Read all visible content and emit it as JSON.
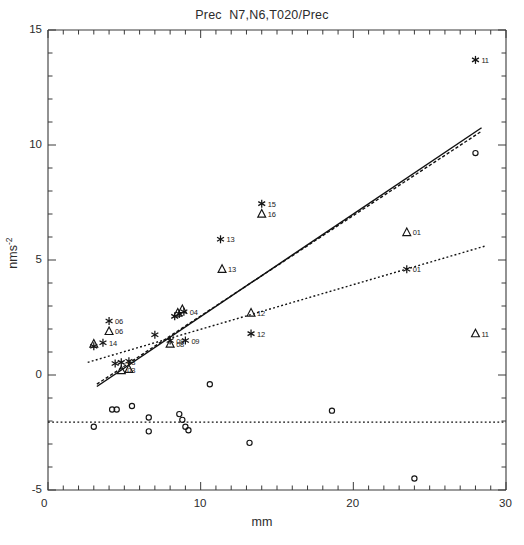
{
  "chart_data": {
    "type": "scatter",
    "title": "Prec  N7,N6,T020/Prec",
    "xlabel": "mm",
    "ylabel": "nms",
    "ylabel_superscript": "-2",
    "xlim": [
      0,
      30
    ],
    "ylim": [
      -5,
      15
    ],
    "x_ticks_major": [
      0,
      10,
      20,
      30
    ],
    "x_tick_labels": [
      "0",
      "10",
      "20",
      "30"
    ],
    "x_minor_interval": 1,
    "y_ticks_major": [
      -5,
      0,
      5,
      10,
      15
    ],
    "y_tick_labels": [
      "-5",
      "0",
      "5",
      "10",
      "15"
    ],
    "y_minor_interval": 1,
    "grid": false,
    "legend": "none",
    "series": [
      {
        "name": "star",
        "marker": "star",
        "points": [
          {
            "x": 28.0,
            "y": 13.7,
            "label": "11"
          },
          {
            "x": 14.0,
            "y": 7.45,
            "label": "15"
          },
          {
            "x": 11.3,
            "y": 5.9,
            "label": "13"
          },
          {
            "x": 23.5,
            "y": 4.6,
            "label": "01"
          },
          {
            "x": 4.0,
            "y": 2.35,
            "label": "06"
          },
          {
            "x": 8.9,
            "y": 2.75,
            "label": "04"
          },
          {
            "x": 8.6,
            "y": 2.65,
            "label": ""
          },
          {
            "x": 8.3,
            "y": 2.55,
            "label": ""
          },
          {
            "x": 7.0,
            "y": 1.75,
            "label": ""
          },
          {
            "x": 13.3,
            "y": 1.8,
            "label": "12"
          },
          {
            "x": 3.0,
            "y": 1.25,
            "label": ""
          },
          {
            "x": 3.6,
            "y": 1.4,
            "label": "14"
          },
          {
            "x": 8.0,
            "y": 1.5,
            "label": "08"
          },
          {
            "x": 9.0,
            "y": 1.5,
            "label": "09"
          },
          {
            "x": 4.8,
            "y": 0.55,
            "label": "03"
          },
          {
            "x": 5.3,
            "y": 0.6,
            "label": ""
          },
          {
            "x": 4.4,
            "y": 0.5,
            "label": ""
          }
        ]
      },
      {
        "name": "triangle",
        "marker": "triangle",
        "points": [
          {
            "x": 14.0,
            "y": 7.0,
            "label": "16"
          },
          {
            "x": 23.5,
            "y": 6.2,
            "label": "01"
          },
          {
            "x": 11.4,
            "y": 4.6,
            "label": "13"
          },
          {
            "x": 8.8,
            "y": 2.85,
            "label": ""
          },
          {
            "x": 8.5,
            "y": 2.7,
            "label": ""
          },
          {
            "x": 13.3,
            "y": 2.7,
            "label": "12"
          },
          {
            "x": 4.0,
            "y": 1.9,
            "label": "06"
          },
          {
            "x": 3.0,
            "y": 1.35,
            "label": ""
          },
          {
            "x": 28.0,
            "y": 1.8,
            "label": "11"
          },
          {
            "x": 8.0,
            "y": 1.35,
            "label": "08"
          },
          {
            "x": 4.8,
            "y": 0.2,
            "label": "03"
          },
          {
            "x": 5.3,
            "y": 0.25,
            "label": ""
          }
        ]
      },
      {
        "name": "circle",
        "marker": "circle",
        "points": [
          {
            "x": 28.0,
            "y": 9.65,
            "label": ""
          },
          {
            "x": 10.6,
            "y": -0.4,
            "label": ""
          },
          {
            "x": 4.2,
            "y": -1.5,
            "label": ""
          },
          {
            "x": 4.5,
            "y": -1.5,
            "label": ""
          },
          {
            "x": 5.5,
            "y": -1.35,
            "label": ""
          },
          {
            "x": 3.0,
            "y": -2.25,
            "label": ""
          },
          {
            "x": 6.6,
            "y": -1.85,
            "label": ""
          },
          {
            "x": 6.6,
            "y": -2.45,
            "label": ""
          },
          {
            "x": 8.6,
            "y": -1.7,
            "label": ""
          },
          {
            "x": 8.8,
            "y": -1.95,
            "label": ""
          },
          {
            "x": 9.0,
            "y": -2.25,
            "label": ""
          },
          {
            "x": 9.2,
            "y": -2.4,
            "label": ""
          },
          {
            "x": 13.2,
            "y": -2.95,
            "label": ""
          },
          {
            "x": 18.6,
            "y": -1.55,
            "label": ""
          },
          {
            "x": 24.0,
            "y": -4.5,
            "label": ""
          }
        ]
      }
    ],
    "fit_lines": [
      {
        "name": "solid-steep",
        "style": "solid",
        "x0": 3.2,
        "y0": -0.5,
        "x1": 28.4,
        "y1": 10.75
      },
      {
        "name": "dashed-steep",
        "style": "dashed",
        "x0": 3.2,
        "y0": -0.4,
        "x1": 28.4,
        "y1": 10.6
      },
      {
        "name": "dotted-shallow",
        "style": "dotted",
        "x0": 2.6,
        "y0": 0.55,
        "x1": 28.6,
        "y1": 5.6
      },
      {
        "name": "reference-horizontal",
        "style": "dotted-ref",
        "x0": 0.0,
        "y0": -2.05,
        "x1": 30.0,
        "y1": -2.05
      }
    ]
  }
}
